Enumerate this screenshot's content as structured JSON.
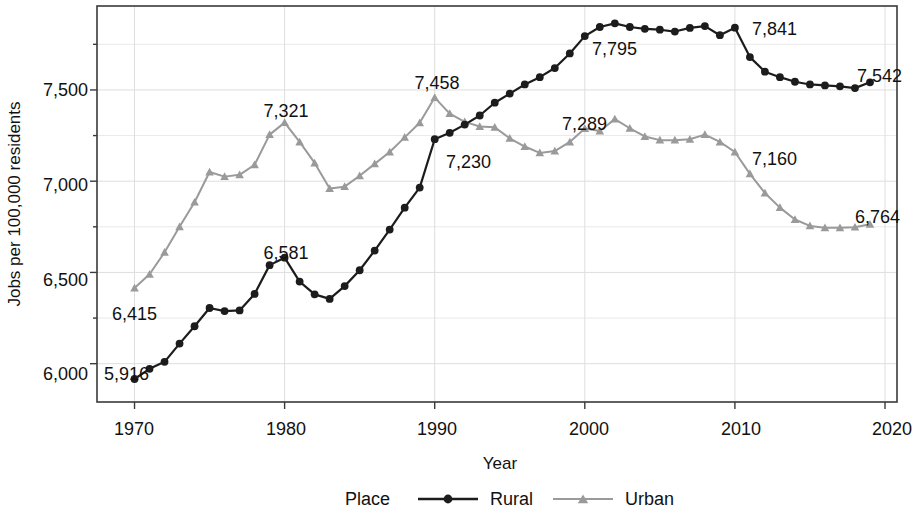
{
  "chart_data": {
    "type": "line",
    "title": "",
    "xlabel": "Year",
    "ylabel": "Jobs per 100,000 residents",
    "xlim": [
      1967.5,
      2020.8
    ],
    "ylim": [
      5790,
      7960
    ],
    "xticks": [
      1970,
      1980,
      1990,
      2000,
      2010,
      2020
    ],
    "xtick_labels": [
      "1970",
      "1980",
      "1990",
      "2000",
      "2010",
      "2020"
    ],
    "yticks": [
      6000,
      6500,
      7000,
      7500
    ],
    "ytick_labels": [
      "6,000",
      "6,500",
      "7,000",
      "7,500"
    ],
    "y_minor_ticks": [
      5750,
      6250,
      6750,
      7250,
      7750
    ],
    "grid": true,
    "legend_position": "bottom",
    "legend_title": "Place",
    "x": [
      1970,
      1971,
      1972,
      1973,
      1974,
      1975,
      1976,
      1977,
      1978,
      1979,
      1980,
      1981,
      1982,
      1983,
      1984,
      1985,
      1986,
      1987,
      1988,
      1989,
      1990,
      1991,
      1992,
      1993,
      1994,
      1995,
      1996,
      1997,
      1998,
      1999,
      2000,
      2001,
      2002,
      2003,
      2004,
      2005,
      2006,
      2007,
      2008,
      2009,
      2010,
      2011,
      2012,
      2013,
      2014,
      2015,
      2016,
      2017,
      2018,
      2019
    ],
    "series": [
      {
        "name": "Rural",
        "color": "#1c1c1c",
        "marker": "circle",
        "values": [
          5916,
          5972,
          6010,
          6110,
          6205,
          6305,
          6288,
          6292,
          6382,
          6540,
          6581,
          6450,
          6380,
          6355,
          6425,
          6512,
          6620,
          6735,
          6855,
          6965,
          7230,
          7265,
          7310,
          7360,
          7430,
          7480,
          7530,
          7570,
          7620,
          7700,
          7795,
          7845,
          7865,
          7845,
          7835,
          7830,
          7820,
          7840,
          7850,
          7800,
          7841,
          7680,
          7600,
          7570,
          7545,
          7530,
          7525,
          7520,
          7510,
          7542
        ]
      },
      {
        "name": "Urban",
        "color": "#9a9a9a",
        "marker": "triangle",
        "values": [
          6415,
          6490,
          6610,
          6750,
          6885,
          7050,
          7025,
          7035,
          7090,
          7255,
          7321,
          7215,
          7100,
          6960,
          6970,
          7030,
          7095,
          7160,
          7240,
          7320,
          7458,
          7370,
          7325,
          7300,
          7295,
          7235,
          7190,
          7155,
          7165,
          7215,
          7289,
          7275,
          7340,
          7290,
          7245,
          7225,
          7225,
          7230,
          7255,
          7215,
          7160,
          7040,
          6935,
          6855,
          6790,
          6755,
          6745,
          6745,
          6748,
          6764
        ]
      }
    ],
    "annotations": [
      {
        "label": "5,916",
        "series": "Rural",
        "year": 1970,
        "value": 5916
      },
      {
        "label": "6,581",
        "series": "Rural",
        "year": 1980,
        "value": 6581
      },
      {
        "label": "7,230",
        "series": "Rural",
        "year": 1990,
        "value": 7230
      },
      {
        "label": "7,795",
        "series": "Rural",
        "year": 2000,
        "value": 7795
      },
      {
        "label": "7,841",
        "series": "Rural",
        "year": 2010,
        "value": 7841
      },
      {
        "label": "7,542",
        "series": "Rural",
        "year": 2019,
        "value": 7542
      },
      {
        "label": "6,415",
        "series": "Urban",
        "year": 1970,
        "value": 6415
      },
      {
        "label": "7,321",
        "series": "Urban",
        "year": 1980,
        "value": 7321
      },
      {
        "label": "7,458",
        "series": "Urban",
        "year": 1990,
        "value": 7458
      },
      {
        "label": "7,289",
        "series": "Urban",
        "year": 2000,
        "value": 7289
      },
      {
        "label": "7,160",
        "series": "Urban",
        "year": 2010,
        "value": 7160
      },
      {
        "label": "6,764",
        "series": "Urban",
        "year": 2019,
        "value": 6764
      }
    ]
  },
  "labels": {
    "y_axis_title": "Jobs per 100,000 residents",
    "x_axis_title": "Year",
    "legend_title": "Place",
    "legend_rural": "Rural",
    "legend_urban": "Urban",
    "ann_5916": "5,916",
    "ann_6581": "6,581",
    "ann_7230": "7,230",
    "ann_7795": "7,795",
    "ann_7841": "7,841",
    "ann_7542": "7,542",
    "ann_6415": "6,415",
    "ann_7321": "7,321",
    "ann_7458": "7,458",
    "ann_7289": "7,289",
    "ann_7160": "7,160",
    "ann_6764": "6,764",
    "ytick_7500": "7,500",
    "ytick_7000": "7,000",
    "ytick_6500": "6,500",
    "ytick_6000": "6,000",
    "xtick_1970": "1970",
    "xtick_1980": "1980",
    "xtick_1990": "1990",
    "xtick_2000": "2000",
    "xtick_2010": "2010",
    "xtick_2020": "2020"
  }
}
